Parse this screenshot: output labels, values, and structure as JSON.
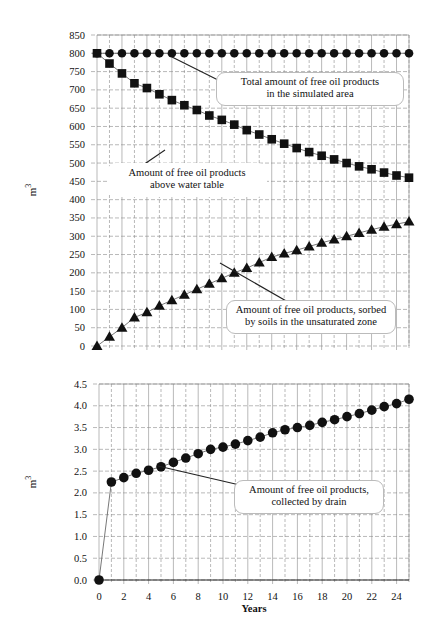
{
  "chart_data": [
    {
      "type": "scatter",
      "panel": "top",
      "title": "",
      "xlabel": "",
      "ylabel": "m3",
      "ylabel_base": "m",
      "ylabel_sup": "3",
      "xlim": [
        0,
        25
      ],
      "ylim": [
        0,
        850
      ],
      "y_ticks": [
        0,
        50,
        100,
        150,
        200,
        250,
        300,
        350,
        400,
        450,
        500,
        550,
        600,
        650,
        700,
        750,
        800,
        850
      ],
      "x_ticks": [],
      "grid": true,
      "legend": "callout annotations",
      "x": [
        0,
        1,
        2,
        3,
        4,
        5,
        6,
        7,
        8,
        9,
        10,
        11,
        12,
        13,
        14,
        15,
        16,
        17,
        18,
        19,
        20,
        21,
        22,
        23,
        24,
        25
      ],
      "series": [
        {
          "name": "Total amount of free oil products in the simulated area",
          "marker": "circle",
          "values": [
            800,
            800,
            800,
            800,
            800,
            800,
            800,
            800,
            800,
            800,
            800,
            800,
            800,
            800,
            800,
            800,
            800,
            800,
            800,
            800,
            800,
            800,
            800,
            800,
            800,
            800
          ]
        },
        {
          "name": "Amount of free oil products above water table",
          "marker": "square",
          "values": [
            800,
            772,
            745,
            718,
            705,
            688,
            672,
            658,
            645,
            630,
            618,
            605,
            590,
            578,
            565,
            553,
            541,
            530,
            520,
            510,
            500,
            491,
            483,
            474,
            466,
            460
          ]
        },
        {
          "name": "Amount of free oil products, sorbed by soils in the unsaturated zone",
          "marker": "triangle",
          "values": [
            0,
            25,
            50,
            78,
            92,
            110,
            125,
            140,
            155,
            170,
            185,
            200,
            213,
            228,
            243,
            253,
            262,
            272,
            282,
            291,
            300,
            309,
            318,
            326,
            333,
            340
          ]
        }
      ],
      "annotations": [
        {
          "text_line1": "Total amount of free oil products",
          "text_line2": "in the simulated area"
        },
        {
          "text_line1": "Amount of free oil products",
          "text_line2": "above water table"
        },
        {
          "text_line1": "Amount of free oil products, sorbed",
          "text_line2": "by soils in the unsaturated zone"
        }
      ]
    },
    {
      "type": "line",
      "panel": "bottom",
      "title": "",
      "xlabel": "Years",
      "ylabel": "m3",
      "ylabel_base": "m",
      "ylabel_sup": "3",
      "xlim": [
        0,
        25
      ],
      "ylim": [
        0,
        4.5
      ],
      "y_ticks": [
        "0.0",
        "0.5",
        "1.0",
        "1.5",
        "2.0",
        "2.5",
        "3.0",
        "3.5",
        "4.0",
        "4.5"
      ],
      "x_ticks": [
        0,
        2,
        4,
        6,
        8,
        10,
        12,
        14,
        16,
        18,
        20,
        22,
        24
      ],
      "grid": true,
      "legend": "callout annotation",
      "x": [
        0,
        1,
        2,
        3,
        4,
        5,
        6,
        7,
        8,
        9,
        10,
        11,
        12,
        13,
        14,
        15,
        16,
        17,
        18,
        19,
        20,
        21,
        22,
        23,
        24,
        25
      ],
      "series": [
        {
          "name": "Amount of free oil products, collected by drain",
          "marker": "circle",
          "values": [
            0.0,
            2.25,
            2.35,
            2.45,
            2.52,
            2.6,
            2.7,
            2.8,
            2.9,
            3.0,
            3.05,
            3.12,
            3.2,
            3.28,
            3.38,
            3.45,
            3.5,
            3.55,
            3.62,
            3.68,
            3.75,
            3.82,
            3.9,
            3.98,
            4.05,
            4.15
          ]
        }
      ],
      "annotations": [
        {
          "text_line1": "Amount of free oil products,",
          "text_line2": "collected by drain"
        }
      ]
    }
  ],
  "colors": {
    "marker": "#111111",
    "grid": "#8a8a8a",
    "axis": "#222222",
    "callout_border": "#bbbbbb",
    "background": "#ffffff"
  }
}
